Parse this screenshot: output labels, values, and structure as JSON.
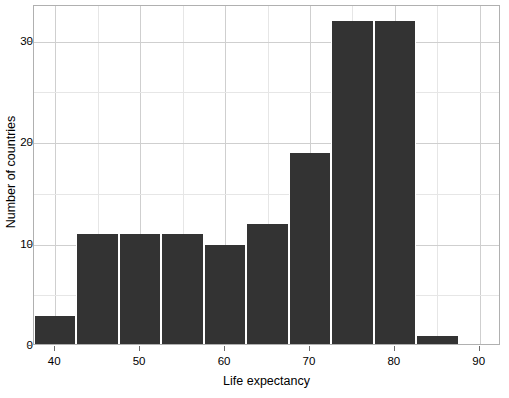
{
  "chart_data": {
    "type": "bar",
    "title": "",
    "xlabel": "Life expectancy",
    "ylabel": "Number of countries",
    "xlim": [
      37.5,
      92.5
    ],
    "ylim": [
      0,
      33.5
    ],
    "xticks": [
      40,
      50,
      60,
      70,
      80,
      90
    ],
    "yticks": [
      0,
      10,
      20,
      30
    ],
    "xtick_labels": [
      "40",
      "50",
      "60",
      "70",
      "80",
      "90"
    ],
    "ytick_labels": [
      "0",
      "10",
      "20",
      "30"
    ],
    "grid": "major and minor gridlines, both axes",
    "legend": "none",
    "bin_width": 5,
    "bar_color": "#333333",
    "bars": [
      {
        "bin_start": 37.5,
        "bin_end": 42.5,
        "center": 40,
        "value": 3
      },
      {
        "bin_start": 42.5,
        "bin_end": 47.5,
        "center": 45,
        "value": 11
      },
      {
        "bin_start": 47.5,
        "bin_end": 52.5,
        "center": 50,
        "value": 11
      },
      {
        "bin_start": 52.5,
        "bin_end": 57.5,
        "center": 55,
        "value": 11
      },
      {
        "bin_start": 57.5,
        "bin_end": 62.5,
        "center": 60,
        "value": 10
      },
      {
        "bin_start": 62.5,
        "bin_end": 67.5,
        "center": 65,
        "value": 12
      },
      {
        "bin_start": 67.5,
        "bin_end": 72.5,
        "center": 70,
        "value": 19
      },
      {
        "bin_start": 72.5,
        "bin_end": 77.5,
        "center": 75,
        "value": 32
      },
      {
        "bin_start": 77.5,
        "bin_end": 82.5,
        "center": 80,
        "value": 32
      },
      {
        "bin_start": 82.5,
        "bin_end": 87.5,
        "center": 85,
        "value": 1
      }
    ],
    "categories": [
      40,
      45,
      50,
      55,
      60,
      65,
      70,
      75,
      80,
      85
    ],
    "values": [
      3,
      11,
      11,
      11,
      10,
      12,
      19,
      32,
      32,
      1
    ]
  },
  "colors": {
    "bar": "#333333",
    "gridline_major": "#cfcfcf",
    "gridline_minor": "#e6e6e6",
    "panel_border": "#b0b0b0",
    "text": "#000000",
    "background": "#ffffff"
  }
}
